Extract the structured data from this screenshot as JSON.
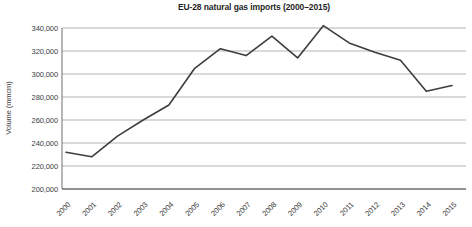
{
  "title": "EU-28 natural gas imports (2000–2015)",
  "chart_data": {
    "type": "line",
    "title": "EU-28 natural gas imports (2000–2015)",
    "xlabel": "",
    "ylabel": "Volume (mmcm)",
    "categories": [
      "2000",
      "2001",
      "2002",
      "2003",
      "2004",
      "2005",
      "2006",
      "2007",
      "2008",
      "2009",
      "2010",
      "2011",
      "2012",
      "2013",
      "2014",
      "2015"
    ],
    "values": [
      232000,
      228000,
      246000,
      260000,
      273000,
      305000,
      322000,
      316000,
      333000,
      314000,
      342000,
      327000,
      319000,
      312000,
      285000,
      290000
    ],
    "ylim": [
      200000,
      340000
    ],
    "ytick_step": 20000,
    "ytick_labels": [
      "200,000",
      "220,000",
      "240,000",
      "260,000",
      "280,000",
      "300,000",
      "320,000",
      "340,000"
    ],
    "grid": "horizontal-only",
    "legend_position": "none",
    "colors": {
      "line": "#3d3d3d",
      "gridline": "#b3b3b3",
      "axis": "#6e6e6e",
      "tick_text": "#3c3c3c",
      "title_text": "#1f1f1f",
      "background": "#ffffff"
    }
  }
}
